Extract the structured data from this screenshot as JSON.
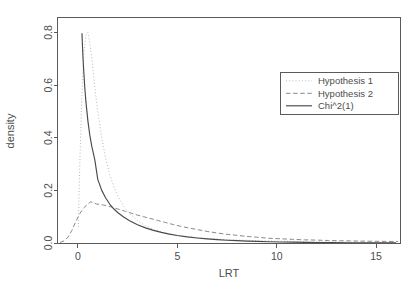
{
  "chart_data": {
    "type": "line",
    "title": "",
    "subtitle": "",
    "xlabel": "LRT",
    "ylabel": "density",
    "xlim": [
      -1.0,
      16.2
    ],
    "ylim": [
      0.0,
      0.855
    ],
    "grid": false,
    "legend_position": "top-right",
    "xticks": [
      0,
      5,
      10,
      15
    ],
    "xtick_labels": [
      "0",
      "5",
      "10",
      "15"
    ],
    "yticks": [
      0.0,
      0.2,
      0.4,
      0.6,
      0.8
    ],
    "ytick_labels": [
      "0.0",
      "0.2",
      "0.4",
      "0.6",
      "0.8"
    ],
    "series": [
      {
        "name": "Hypothesis 1",
        "style": "dotted",
        "color": "#b9b9b9",
        "x": [
          0.02,
          0.1,
          0.2,
          0.3,
          0.4,
          0.5,
          0.6,
          0.7,
          0.8,
          0.9,
          1.0,
          1.2,
          1.4,
          1.6,
          1.8,
          2.0,
          2.3,
          2.6,
          3.0,
          3.4,
          3.8,
          4.2,
          4.6,
          5.0,
          5.4,
          5.8,
          6.2,
          6.6,
          7.0,
          7.5,
          8.0,
          8.5,
          9.0,
          9.5,
          10.0,
          10.6,
          11.2,
          11.8,
          12.4,
          13.0,
          13.6,
          14.2,
          14.8,
          15.4,
          16.0
        ],
        "y": [
          0.06,
          0.31,
          0.56,
          0.72,
          0.79,
          0.8,
          0.76,
          0.7,
          0.63,
          0.56,
          0.5,
          0.4,
          0.32,
          0.26,
          0.215,
          0.18,
          0.14,
          0.112,
          0.085,
          0.066,
          0.052,
          0.042,
          0.035,
          0.029,
          0.025,
          0.022,
          0.019,
          0.017,
          0.015,
          0.013,
          0.0115,
          0.0102,
          0.009,
          0.008,
          0.0072,
          0.0063,
          0.0055,
          0.0048,
          0.0042,
          0.0037,
          0.0033,
          0.0029,
          0.0026,
          0.0023,
          0.002
        ]
      },
      {
        "name": "Hypothesis 2",
        "style": "dashed",
        "color": "#8a8a8a",
        "x": [
          -0.9,
          -0.7,
          -0.5,
          -0.3,
          -0.1,
          0.1,
          0.3,
          0.5,
          0.65,
          0.8,
          0.95,
          1.1,
          1.3,
          1.5,
          1.8,
          2.1,
          2.4,
          2.7,
          3.0,
          3.3,
          3.6,
          4.0,
          4.4,
          4.8,
          5.2,
          5.6,
          6.0,
          6.5,
          7.0,
          7.5,
          8.0,
          8.5,
          9.0,
          9.6,
          10.2,
          10.8,
          11.4,
          12.0,
          12.6,
          13.2,
          13.8,
          14.4,
          15.0,
          15.6,
          16.1
        ],
        "y": [
          0.002,
          0.008,
          0.022,
          0.048,
          0.082,
          0.112,
          0.134,
          0.148,
          0.157,
          0.152,
          0.148,
          0.147,
          0.144,
          0.141,
          0.134,
          0.127,
          0.12,
          0.113,
          0.106,
          0.1,
          0.094,
          0.086,
          0.078,
          0.07,
          0.063,
          0.057,
          0.051,
          0.044,
          0.038,
          0.033,
          0.029,
          0.025,
          0.022,
          0.018,
          0.016,
          0.014,
          0.012,
          0.011,
          0.0095,
          0.0085,
          0.0078,
          0.007,
          0.0065,
          0.006,
          0.0055
        ]
      },
      {
        "name": "Chi^2(1)",
        "style": "solid",
        "color": "#4a4a4a",
        "x": [
          0.205,
          0.23,
          0.26,
          0.3,
          0.35,
          0.4,
          0.5,
          0.6,
          0.7,
          0.85,
          1.0,
          1.2,
          1.4,
          1.6,
          1.8,
          2.0,
          2.3,
          2.6,
          3.0,
          3.4,
          3.8,
          4.2,
          4.6,
          5.0,
          5.5,
          6.0,
          6.5,
          7.0,
          7.5,
          8.0,
          8.5,
          9.0,
          9.6,
          10.2,
          10.8,
          11.4,
          12.0,
          12.8,
          13.6,
          14.4,
          15.2,
          16.0
        ],
        "y": [
          0.797,
          0.75,
          0.7,
          0.646,
          0.588,
          0.54,
          0.466,
          0.41,
          0.367,
          0.317,
          0.242,
          0.2,
          0.171,
          0.148,
          0.13,
          0.116,
          0.0985,
          0.0845,
          0.0694,
          0.0575,
          0.0479,
          0.0402,
          0.0338,
          0.0285,
          0.0232,
          0.019,
          0.0156,
          0.0128,
          0.0106,
          0.0088,
          0.0073,
          0.006,
          0.0048,
          0.0039,
          0.0031,
          0.0025,
          0.002,
          0.0015,
          0.0011,
          0.0008,
          0.0006,
          0.0004
        ]
      }
    ]
  },
  "legend": {
    "entries": [
      {
        "label": "Hypothesis 1"
      },
      {
        "label": "Hypothesis 2"
      },
      {
        "label": "Chi^2(1)"
      }
    ]
  },
  "axes": {
    "x_title": "LRT",
    "y_title": "density"
  }
}
